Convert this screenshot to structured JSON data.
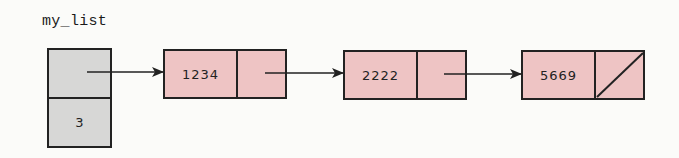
{
  "diagram": {
    "type": "singly-linked-list",
    "variable_name": "my_list",
    "header": {
      "head_pointer": "points-to-first-node",
      "size": "3"
    },
    "nodes": [
      {
        "data": "1234",
        "next": "pointer"
      },
      {
        "data": "2222",
        "next": "pointer"
      },
      {
        "data": "5669",
        "next": "null"
      }
    ],
    "colors": {
      "header_fill": "#d7d7d6",
      "node_fill": "#eec4c4",
      "stroke": "#222222",
      "background": "#fbfbf9"
    }
  }
}
